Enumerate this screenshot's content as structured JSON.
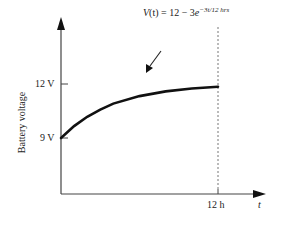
{
  "chart_data": {
    "type": "line",
    "title": "",
    "annotation": "V(t) = 12 − 3e^(−3t/12 hrs)",
    "xlabel": "t",
    "ylabel": "Battery voltage",
    "x_ticks": [
      "12 h"
    ],
    "y_ticks": [
      "9 V",
      "12 V"
    ],
    "xlim": [
      0,
      12
    ],
    "ylim": [
      9,
      12
    ],
    "grid": false,
    "legend": null,
    "series": [
      {
        "name": "V(t)",
        "x": [
          0,
          1,
          2,
          3,
          4,
          6,
          8,
          10,
          12
        ],
        "values": [
          9.0,
          9.66,
          10.18,
          10.58,
          10.91,
          11.33,
          11.59,
          11.75,
          11.85
        ]
      }
    ],
    "reference_lines": [
      {
        "axis": "x",
        "value": 12,
        "style": "dashed"
      }
    ]
  },
  "labels": {
    "equation_v": "V",
    "equation_t": "(t)",
    "equation_rest": " = 12 − 3",
    "equation_e": "e",
    "equation_exp": "−3t/12 hrs",
    "ylabel": "Battery voltage",
    "ytick_12": "12 V",
    "ytick_9": "9 V",
    "xtick_12": "12 h",
    "xlabel": "t"
  }
}
